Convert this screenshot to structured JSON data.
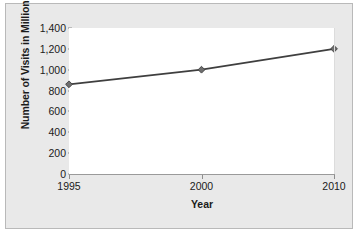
{
  "chart_data": {
    "type": "line",
    "title": "",
    "subtitle": "",
    "xlabel": "Year",
    "ylabel": "Number of Visits in Millions",
    "categories": [
      "1995",
      "2000",
      "2010"
    ],
    "values": [
      860,
      1000,
      1200
    ],
    "series": [
      {
        "name": "Number of Visits in Millions",
        "values": [
          860,
          1000,
          1200
        ]
      }
    ],
    "ylim": [
      0,
      1400
    ],
    "yticks": [
      0,
      200,
      400,
      600,
      800,
      1000,
      1200,
      1400
    ],
    "ytick_labels": [
      "0",
      "200",
      "400",
      "600",
      "800",
      "1,000",
      "1,200",
      "1,400"
    ],
    "xtick_labels": [
      "1995",
      "2000",
      "2010"
    ],
    "grid": false,
    "legend": false,
    "legend_position": "none",
    "marker": "diamond",
    "colors": {
      "line": "#3f3f3f",
      "marker": "#6e6e6e",
      "marker_edge": "#3f3f3f",
      "plot_background": "#ffffff",
      "figure_background": "#e9e9e9",
      "figure_border": "#b9b9b9",
      "axis": "#9a9a9a",
      "text": "#1b1b1b"
    }
  }
}
